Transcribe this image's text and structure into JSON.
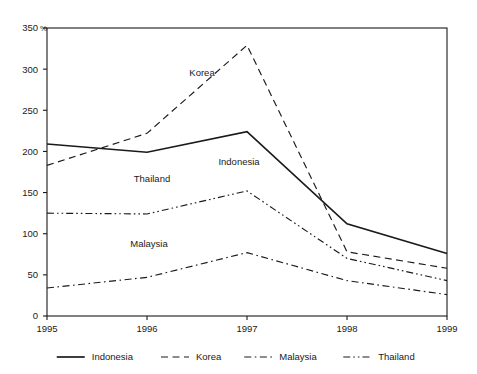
{
  "chart_data": {
    "type": "line",
    "title": "",
    "subtitle": "",
    "xlabel": "",
    "ylabel": "",
    "unit_label": "%",
    "categories": [
      "1995",
      "1996",
      "1997",
      "1998",
      "1999"
    ],
    "x": [
      1995,
      1996,
      1997,
      1998,
      1999
    ],
    "ylim": [
      0,
      350
    ],
    "yticks": [
      0,
      50,
      100,
      150,
      200,
      250,
      300,
      350
    ],
    "ytick_labels": [
      "0",
      "50",
      "100",
      "150",
      "200",
      "250",
      "300",
      "350"
    ],
    "xtick_labels": [
      "1995",
      "1996",
      "1997",
      "1998",
      "1999"
    ],
    "grid": false,
    "legend_position": "bottom",
    "series": [
      {
        "name": "Indonesia",
        "values": [
          209,
          199,
          224,
          112,
          76
        ],
        "line_style": "solid",
        "color": "#1a1a1a",
        "inline_label": "Indonesia"
      },
      {
        "name": "Korea",
        "values": [
          183,
          222,
          329,
          78,
          58
        ],
        "line_style": "dashed",
        "color": "#1a1a1a",
        "inline_label": "Korea"
      },
      {
        "name": "Malaysia",
        "values": [
          34,
          47,
          77,
          43,
          26
        ],
        "line_style": "dash-dot",
        "color": "#1a1a1a",
        "inline_label": "Malaysia"
      },
      {
        "name": "Thailand",
        "values": [
          125,
          124,
          152,
          70,
          43
        ],
        "line_style": "dash-dot-dot",
        "color": "#1a1a1a",
        "inline_label": "Thailand"
      }
    ],
    "legend": [
      {
        "label": "Indonesia",
        "line_style": "solid"
      },
      {
        "label": "Korea",
        "line_style": "dashed"
      },
      {
        "label": "Malaysia",
        "line_style": "dash-dot"
      },
      {
        "label": "Thailand",
        "line_style": "dash-dot-dot"
      }
    ],
    "annotations": [
      {
        "text": "Korea",
        "x": 1996.55,
        "y": 292
      },
      {
        "text": "Indonesia",
        "x": 1996.92,
        "y": 183
      },
      {
        "text": "Thailand",
        "x": 1996.05,
        "y": 163
      },
      {
        "text": "Malaysia",
        "x": 1996.02,
        "y": 84
      }
    ]
  }
}
